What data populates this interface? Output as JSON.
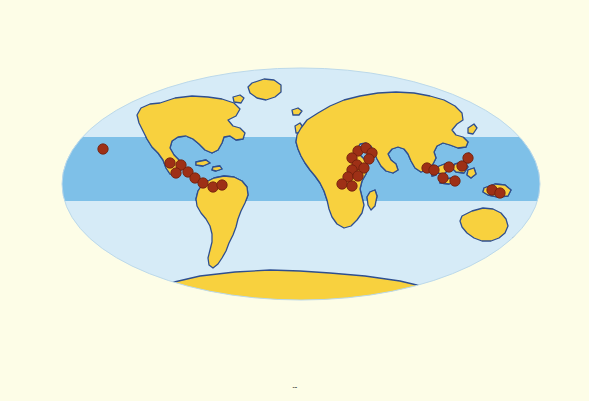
{
  "figure": {
    "name": "world-distribution-map",
    "background_color": "#fdfde7",
    "caption_fragment": "ü"
  },
  "map": {
    "projection": "Mollweide",
    "title": "",
    "ocean_color": "#d6ebf7",
    "ocean_tropical_color": "#7ec0e8",
    "land_color": "#f8d13e",
    "land_tropical_color": "#d9a827",
    "coastline_color": "#2f4f8f",
    "marker_color": "#9e3016",
    "marker_edge_color": "#6e1f0c",
    "ellipse": {
      "center_x": 301,
      "center_y": 184,
      "radius_x": 239,
      "radius_y": 116
    },
    "tropical_band": {
      "label": "Tropical belt",
      "top_y": 137,
      "bottom_y": 201
    }
  },
  "markers": {
    "label": "Occurrence localities",
    "count": 30,
    "radius": 5.2,
    "points": [
      {
        "name": "pacific-ocean-site",
        "x": 103,
        "y": 149
      },
      {
        "name": "west-mexico-site",
        "x": 170,
        "y": 163
      },
      {
        "name": "central-mexico-site",
        "x": 181,
        "y": 165
      },
      {
        "name": "south-mexico-site",
        "x": 176,
        "y": 173
      },
      {
        "name": "guatemala-site",
        "x": 188,
        "y": 172
      },
      {
        "name": "caribbean-site",
        "x": 195,
        "y": 178
      },
      {
        "name": "panama-site",
        "x": 203,
        "y": 183
      },
      {
        "name": "colombia-site",
        "x": 213,
        "y": 187
      },
      {
        "name": "venezuela-site",
        "x": 222,
        "y": 185
      },
      {
        "name": "arabia-north-site",
        "x": 358,
        "y": 151
      },
      {
        "name": "arabia-site",
        "x": 366,
        "y": 148
      },
      {
        "name": "red-sea-site",
        "x": 372,
        "y": 153
      },
      {
        "name": "horn-of-africa-site",
        "x": 369,
        "y": 159
      },
      {
        "name": "sudan-site",
        "x": 352,
        "y": 158
      },
      {
        "name": "ethiopia-site",
        "x": 357,
        "y": 165
      },
      {
        "name": "kenya-site",
        "x": 364,
        "y": 168
      },
      {
        "name": "uganda-site",
        "x": 352,
        "y": 170
      },
      {
        "name": "congo-site",
        "x": 348,
        "y": 177
      },
      {
        "name": "tanzania-site",
        "x": 358,
        "y": 176
      },
      {
        "name": "zambia-site",
        "x": 342,
        "y": 184
      },
      {
        "name": "malawi-site",
        "x": 352,
        "y": 186
      },
      {
        "name": "india-south-site",
        "x": 427,
        "y": 168
      },
      {
        "name": "sri-lanka-site",
        "x": 434,
        "y": 170
      },
      {
        "name": "sumatra-site",
        "x": 449,
        "y": 167
      },
      {
        "name": "borneo-site",
        "x": 462,
        "y": 166
      },
      {
        "name": "java-site",
        "x": 443,
        "y": 178
      },
      {
        "name": "sulawesi-site",
        "x": 455,
        "y": 181
      },
      {
        "name": "new-guinea-west-site",
        "x": 492,
        "y": 190
      },
      {
        "name": "new-guinea-east-site",
        "x": 500,
        "y": 193
      },
      {
        "name": "philippines-site",
        "x": 468,
        "y": 158
      }
    ]
  }
}
